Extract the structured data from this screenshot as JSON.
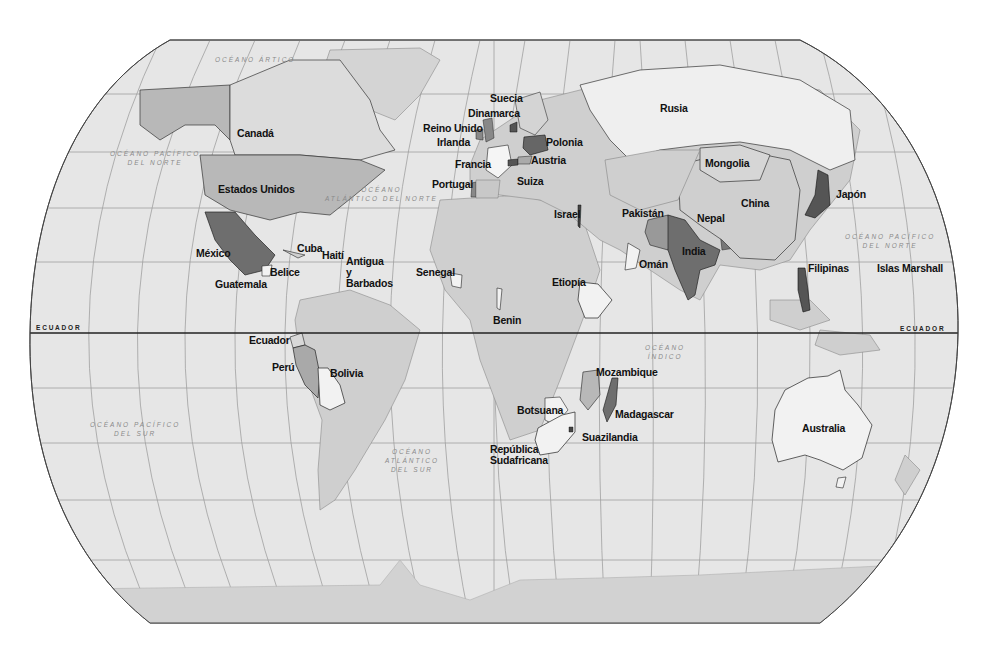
{
  "map": {
    "title": "World map (Spanish labels)",
    "colors": {
      "background": "#ffffff",
      "ocean": "#e6e6e6",
      "graticule": "#9a9a9a",
      "land_default": "#cfcfcf",
      "land_light": "#f2f2f2",
      "land_medium": "#b8b8b8",
      "land_dark": "#6e6e6e",
      "equator": "#222222",
      "antarctica": "#d2d2d2"
    },
    "equator_labels": [
      "ECUADOR",
      "ECUADOR"
    ],
    "oceans": [
      {
        "id": "arctic",
        "line1": "OCÉANO ÁRTICO",
        "line2": ""
      },
      {
        "id": "north-pacific-west",
        "line1": "OCÉANO PACÍFICO",
        "line2": "DEL NORTE"
      },
      {
        "id": "north-atlantic",
        "line1": "OCÉANO",
        "line2": "ATLÁNTICO DEL NORTE"
      },
      {
        "id": "north-pacific-east",
        "line1": "OCÉANO PACÍFICO",
        "line2": "DEL NORTE"
      },
      {
        "id": "indian",
        "line1": "OCÉANO",
        "line2": "ÍNDICO"
      },
      {
        "id": "south-pacific",
        "line1": "OCÉANO PACÍFICO",
        "line2": "DEL SUR"
      },
      {
        "id": "south-atlantic",
        "line1": "OCÉANO",
        "line2": "ATLÁNTICO",
        "line3": "DEL SUR"
      }
    ],
    "countries": {
      "canada": "Canadá",
      "usa": "Estados Unidos",
      "mexico": "México",
      "cuba": "Cuba",
      "haiti": "Haití",
      "antigua1": "Antigua",
      "antigua2": "y",
      "antigua3": "Barbados",
      "belize": "Belice",
      "guatemala": "Guatemala",
      "senegal": "Senegal",
      "ecuador": "Ecuador",
      "peru": "Perú",
      "bolivia": "Bolivia",
      "sweden": "Suecia",
      "denmark": "Dinamarca",
      "uk": "Reino Unido",
      "ireland": "Irlanda",
      "france": "Francia",
      "portugal": "Portugal",
      "poland": "Polonia",
      "austria": "Austria",
      "switzerland": "Suiza",
      "russia": "Rusia",
      "mongolia": "Mongolia",
      "china": "China",
      "japan": "Japón",
      "pakistan": "Pakistán",
      "nepal": "Nepal",
      "india": "India",
      "oman": "Omán",
      "israel": "Israel",
      "ethiopia": "Etiopía",
      "benin": "Benin",
      "philippines": "Filipinas",
      "marshall": "Islas Marshall",
      "mozambique": "Mozambique",
      "madagascar": "Madagascar",
      "botswana": "Botsuana",
      "swaziland": "Suazilandia",
      "south_africa1": "República",
      "south_africa2": "Sudafricana",
      "australia": "Australia"
    }
  }
}
